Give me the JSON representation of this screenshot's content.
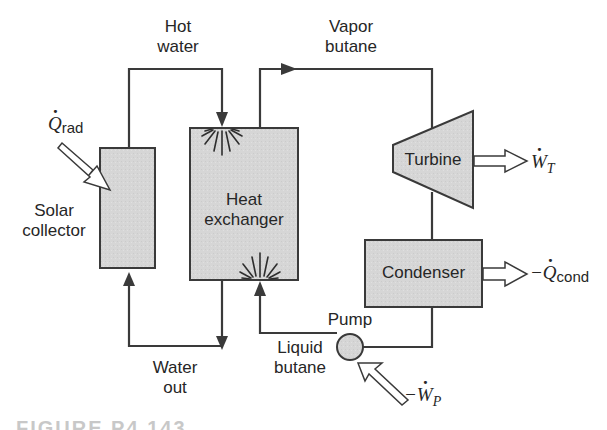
{
  "diagram": {
    "components": {
      "solar_collector": {
        "label_line1": "Solar",
        "label_line2": "collector"
      },
      "heat_exchanger": {
        "label_line1": "Heat",
        "label_line2": "exchanger"
      },
      "turbine": {
        "label": "Turbine"
      },
      "condenser": {
        "label": "Condenser"
      },
      "pump": {
        "label": "Pump"
      }
    },
    "streams": {
      "hot_water": {
        "line1": "Hot",
        "line2": "water"
      },
      "water_out": {
        "line1": "Water",
        "line2": "out"
      },
      "vapor_butane": {
        "line1": "Vapor",
        "line2": "butane"
      },
      "liquid_butane": {
        "line1": "Liquid",
        "line2": "butane"
      }
    },
    "energy_flows": {
      "q_rad": {
        "symbol": "Q",
        "subscript": "rad",
        "sign": ""
      },
      "w_t": {
        "symbol": "W",
        "subscript": "T",
        "sign": ""
      },
      "q_cond": {
        "symbol": "Q",
        "subscript": "cond",
        "sign": "−"
      },
      "w_p": {
        "symbol": "W",
        "subscript": "P",
        "sign": "−"
      }
    },
    "caption": "FIGURE P4.143"
  },
  "colors": {
    "line": "#3a3a3a",
    "fill": "#d4d4d4",
    "text": "#262626",
    "background": "#ffffff"
  }
}
